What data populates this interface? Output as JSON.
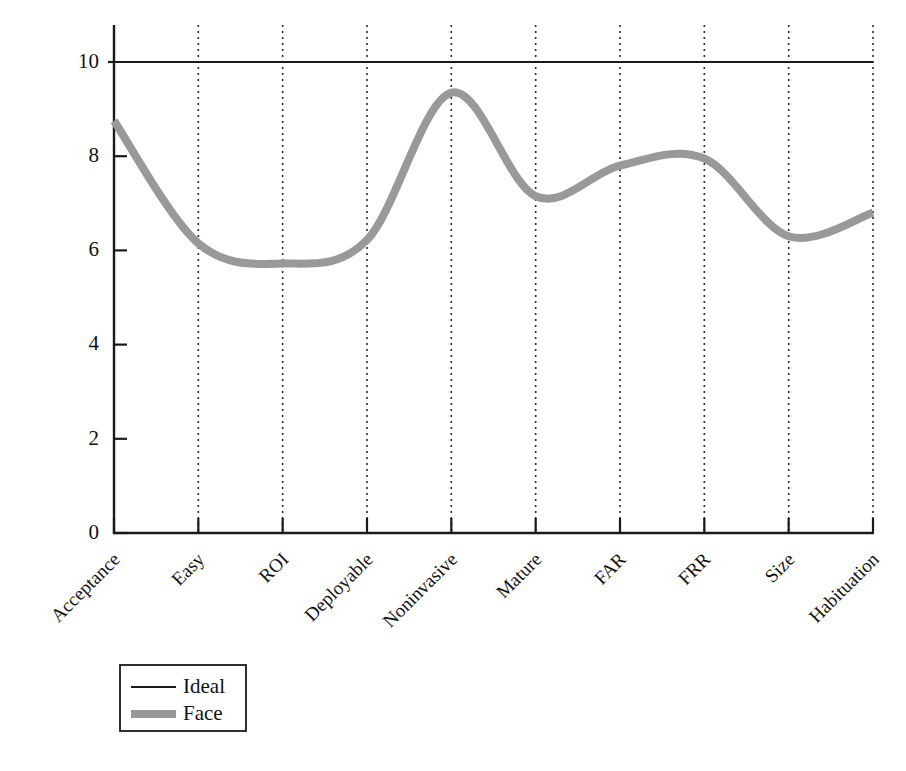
{
  "chart_data": {
    "type": "line",
    "title": "",
    "subtitle": "",
    "xlabel": "",
    "ylabel": "",
    "categories": [
      "Acceptance",
      "Easy",
      "ROI",
      "Deployable",
      "Noninvasive",
      "Mature",
      "FAR",
      "FRR",
      "Size",
      "Habituation"
    ],
    "ylim": [
      0,
      10
    ],
    "ytick_labels": [
      "0",
      "2",
      "4",
      "6",
      "8",
      "10"
    ],
    "yticks": [
      0,
      2,
      4,
      6,
      8,
      10
    ],
    "grid": "vertical-dotted-at-categories",
    "legend_position": "below-plot-left",
    "smoothing": "spline",
    "series": [
      {
        "name": "Ideal",
        "values": [
          10,
          10,
          10,
          10,
          10,
          10,
          10,
          10,
          10,
          10
        ],
        "color": "#1a1a1a",
        "width": 2.2,
        "style": "solid"
      },
      {
        "name": "Face",
        "values": [
          8.75,
          6.15,
          5.72,
          6.22,
          9.35,
          7.15,
          7.8,
          7.95,
          6.3,
          6.8
        ],
        "color": "#999999",
        "width": 8,
        "style": "solid"
      }
    ]
  },
  "legend": {
    "entries": [
      {
        "label": "Ideal",
        "swatch": "thin-black-line"
      },
      {
        "label": "Face",
        "swatch": "thick-gray-line"
      }
    ]
  },
  "colors": {
    "ideal_line": "#1a1a1a",
    "face_line": "#999999",
    "axis": "#1a1a1a",
    "gridline": "#2b2b2b",
    "background": "#ffffff"
  }
}
